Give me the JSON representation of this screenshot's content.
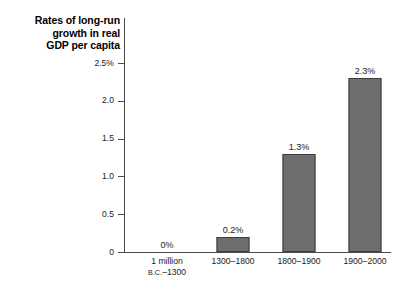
{
  "chart_data": {
    "type": "bar",
    "title": "",
    "ylabel": "Rates of long-run growth in real GDP per capita",
    "ylabel_lines": [
      "Rates of long-run",
      "growth in real",
      "GDP per capita"
    ],
    "xlabel": "",
    "categories": [
      "1 million B.C.–1300",
      "1300–1800",
      "1800–1900",
      "1900–2000"
    ],
    "category_lines": [
      {
        "line1": "1 million",
        "line2_prefix": "B.C.",
        "line2_rest": "–1300"
      },
      {
        "line1": "1300–1800",
        "line2_prefix": "",
        "line2_rest": ""
      },
      {
        "line1": "1800–1900",
        "line2_prefix": "",
        "line2_rest": ""
      },
      {
        "line1": "1900–2000",
        "line2_prefix": "",
        "line2_rest": ""
      }
    ],
    "values": [
      0,
      0.2,
      1.3,
      2.3
    ],
    "data_labels": [
      "0%",
      "0.2%",
      "1.3%",
      "2.3%"
    ],
    "ylim": [
      0,
      2.5
    ],
    "yticks": [
      0,
      0.5,
      1.0,
      1.5,
      2.0,
      2.5
    ],
    "ytick_labels": [
      "0",
      "0.5",
      "1.0",
      "1.5",
      "2.0",
      "2.5%"
    ],
    "grid": false,
    "legend": false,
    "bar_color": "#6e6e6e",
    "bar_edge_color": "#3d3d3d",
    "axis_color": "#4a4a4a",
    "background": "#ffffff"
  }
}
